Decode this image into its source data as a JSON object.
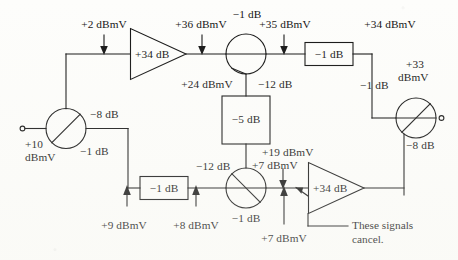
{
  "figure": {
    "background_color": "#fdfdfb",
    "ink_color": "#111111",
    "type": "signal-level-block-diagram"
  },
  "annotation": {
    "cancel_note_line1": "These signals",
    "cancel_note_line2": "cancel."
  },
  "components": {
    "amplifier_top": {
      "gain_label": "+34 dB"
    },
    "amplifier_bottom": {
      "gain_label": "+34 dB"
    },
    "attenuator_top_right": {
      "loss_label": "−1 dB"
    },
    "attenuator_middle": {
      "loss_label": "−5 dB"
    },
    "attenuator_bottom_left": {
      "loss_label": "−1 dB"
    },
    "splitter_input": {
      "tap_loss_label": "−8 dB",
      "through_loss_label": "−1 dB"
    },
    "combiner_top": {
      "through_loss_label": "−1 dB",
      "tap_loss_label": "−12 dB"
    },
    "combiner_bottom": {
      "tap_loss_label": "−12 dB",
      "through_loss_label": "−1 dB"
    },
    "splitter_output": {
      "tap_loss_label": "−8 dB"
    }
  },
  "levels": {
    "input": {
      "line1": "+10",
      "line2": "dBmV"
    },
    "amp_top_in": "+2 dBmV",
    "amp_top_out": "+36 dBmV",
    "combiner_top_out": "+35 dBmV",
    "combiner_top_tap": "+24 dBmV",
    "after_attenuator_top_right": "+34 dBmV",
    "output": {
      "line1": "+33",
      "line2": "dBmV"
    },
    "attenuator_bottom_in": "+9 dBmV",
    "attenuator_bottom_out": "+8 dBmV",
    "combiner_bottom_tap_in": "+19 dBmV",
    "amp_bottom_in_upper": "+7 dBmV",
    "amp_bottom_in_lower": "+7 dBmV"
  },
  "layout": {
    "width": 458,
    "height": 260
  }
}
